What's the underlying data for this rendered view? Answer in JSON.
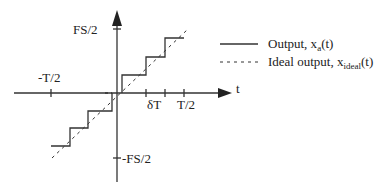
{
  "diagram": {
    "axes": {
      "x_label": "t",
      "y_top_label": "FS/2",
      "y_bottom_label": "-FS/2",
      "x_ticks": [
        {
          "label": "-T/2"
        },
        {
          "label": "δT"
        },
        {
          "label": "T/2"
        }
      ]
    },
    "legend": {
      "items": [
        {
          "style": "solid",
          "text": "Output, x",
          "sub": "a",
          "suffix": "(t)"
        },
        {
          "style": "dashed",
          "text": "Ideal output, x",
          "sub": "ideal",
          "suffix": "(t)"
        }
      ]
    },
    "colors": {
      "line": "#333333",
      "background": "#ffffff"
    }
  }
}
